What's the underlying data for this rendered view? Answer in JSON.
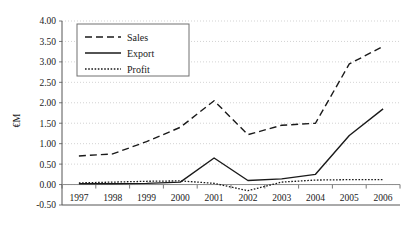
{
  "chart_data": {
    "type": "line",
    "title": "",
    "xlabel": "",
    "ylabel": "€M",
    "categories": [
      "1997",
      "1998",
      "1999",
      "2000",
      "2001",
      "2002",
      "2003",
      "2004",
      "2005",
      "2006"
    ],
    "x": [
      1997,
      1998,
      1999,
      2000,
      2001,
      2002,
      2003,
      2004,
      2005,
      2006
    ],
    "ylim": [
      -0.5,
      4.0
    ],
    "yticks": [
      -0.5,
      0.0,
      0.5,
      1.0,
      1.5,
      2.0,
      2.5,
      3.0,
      3.5,
      4.0
    ],
    "ytick_labels": [
      "-0.50",
      "0.00",
      "0.50",
      "1.00",
      "1.50",
      "2.00",
      "2.50",
      "3.00",
      "3.50",
      "4.00"
    ],
    "grid": true,
    "grid_style": "dotted-horizontal",
    "legend_position": "top-left",
    "series": [
      {
        "name": "Sales",
        "style": "dashed",
        "values": [
          0.7,
          0.75,
          1.05,
          1.4,
          2.05,
          1.22,
          1.45,
          1.5,
          2.95,
          3.38
        ]
      },
      {
        "name": "Export",
        "style": "solid",
        "values": [
          0.02,
          0.02,
          0.03,
          0.06,
          0.65,
          0.1,
          0.14,
          0.25,
          1.2,
          1.85
        ]
      },
      {
        "name": "Profit",
        "style": "dotted",
        "values": [
          0.04,
          0.06,
          0.08,
          0.09,
          0.03,
          -0.15,
          0.06,
          0.11,
          0.12,
          0.12
        ]
      }
    ]
  },
  "legend": {
    "items": [
      {
        "label": "Sales"
      },
      {
        "label": "Export"
      },
      {
        "label": "Profit"
      }
    ]
  },
  "axis": {
    "y_title": "€M"
  },
  "colors": {
    "line": "#1a1a1a",
    "grid": "#c8c8c8",
    "axis": "#555555",
    "background": "#ffffff"
  }
}
